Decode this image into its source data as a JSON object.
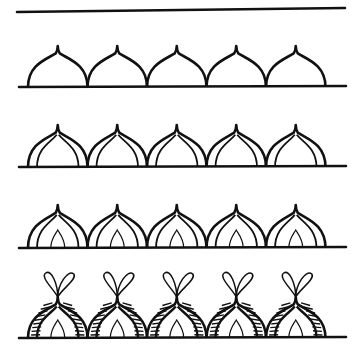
{
  "colors": {
    "ink": "#111111",
    "background": "#ffffff"
  },
  "top_line": {
    "x1": 17,
    "y1": 12,
    "x2": 345,
    "y2": 8
  },
  "arch_width": 59.5,
  "rows": [
    {
      "name": "row-1-plain-domes",
      "baseline_y": 87,
      "tip_y": 46,
      "start_x": 28,
      "count": 5,
      "baseline_x1": 19,
      "baseline_x2": 346,
      "style": "plain"
    },
    {
      "name": "row-2-double-outline-domes",
      "baseline_y": 167,
      "tip_y": 125,
      "start_x": 28,
      "count": 5,
      "baseline_x1": 19,
      "baseline_x2": 346,
      "style": "double"
    },
    {
      "name": "row-3-domes-with-petal",
      "baseline_y": 248,
      "tip_y": 205,
      "start_x": 28,
      "count": 5,
      "baseline_x1": 19,
      "baseline_x2": 346,
      "style": "petal"
    },
    {
      "name": "row-4-striped-domes-with-loops",
      "baseline_y": 338,
      "tip_y": 295,
      "start_x": 28,
      "count": 5,
      "baseline_x1": 19,
      "baseline_x2": 346,
      "style": "striped"
    }
  ]
}
